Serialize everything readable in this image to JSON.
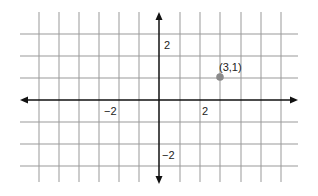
{
  "diagram": {
    "type": "coordinate-plane",
    "grid": {
      "x_lines": [
        39,
        59,
        79,
        99,
        119,
        139,
        180,
        200,
        220,
        241,
        261,
        281
      ],
      "y_lines": [
        34,
        56,
        78,
        122,
        144,
        166
      ],
      "x_extent": [
        20,
        298
      ],
      "y_extent": [
        12,
        182
      ],
      "color": "#999999"
    },
    "axes": {
      "origin_px": [
        159,
        100
      ],
      "x_range": [
        20,
        298
      ],
      "y_range": [
        12,
        184
      ],
      "color": "#111111"
    },
    "labels": {
      "x_neg": "−2",
      "x_pos": "2",
      "y_pos": "2",
      "y_neg": "−2"
    },
    "point": {
      "label": "(3,1)",
      "x": 3,
      "y": 1,
      "px": [
        220,
        77
      ],
      "color": "#8a8a8a"
    }
  }
}
